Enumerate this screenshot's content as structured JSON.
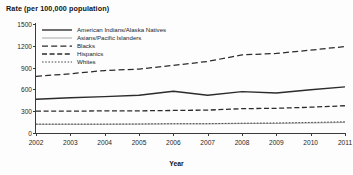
{
  "chart_data": {
    "type": "line",
    "title": "Rate (per 100,000 population)",
    "xlabel": "Year",
    "ylabel": "",
    "categories": [
      "2002",
      "2003",
      "2004",
      "2005",
      "2006",
      "2007",
      "2008",
      "2009",
      "2010",
      "2011"
    ],
    "x": [
      2002,
      2003,
      2004,
      2005,
      2006,
      2007,
      2008,
      2009,
      2010,
      2011
    ],
    "xlim": [
      2002,
      2011
    ],
    "ylim": [
      0,
      1500
    ],
    "yticks": [
      0,
      300,
      600,
      900,
      1200,
      1500
    ],
    "ytick_labels": [
      "0",
      "300",
      "600",
      "900",
      "1200",
      "1500"
    ],
    "xticks": [
      2002,
      2003,
      2004,
      2005,
      2006,
      2007,
      2008,
      2009,
      2010,
      2011
    ],
    "xtick_labels": [
      "2002",
      "2003",
      "2004",
      "2005",
      "2006",
      "2007",
      "2008",
      "2009",
      "2010",
      "2011"
    ],
    "grid": false,
    "legend_position": "upper-left-inside",
    "series": [
      {
        "name": "American Indians/Alaska Natives",
        "style": "solid",
        "color": "#2b2b2b",
        "values": [
          465,
          485,
          500,
          520,
          575,
          520,
          570,
          550,
          595,
          635
        ]
      },
      {
        "name": "Asians/Pacific Islanders",
        "style": "thin-solid",
        "color": "#8c8c8c",
        "values": [
          120,
          120,
          120,
          122,
          125,
          125,
          130,
          132,
          138,
          145
        ]
      },
      {
        "name": "Blacks",
        "style": "long-dash",
        "color": "#2b2b2b",
        "values": [
          780,
          815,
          860,
          880,
          930,
          985,
          1075,
          1095,
          1140,
          1190
        ]
      },
      {
        "name": "Hispanics",
        "style": "dash",
        "color": "#2b2b2b",
        "values": [
          300,
          300,
          305,
          305,
          310,
          315,
          335,
          340,
          355,
          375
        ]
      },
      {
        "name": "Whites",
        "style": "dotted",
        "color": "#4a4a4a",
        "values": [
          122,
          122,
          122,
          124,
          128,
          128,
          135,
          138,
          145,
          155
        ]
      }
    ]
  },
  "legend": {
    "entries": [
      {
        "label": "American Indians/Alaska Natives"
      },
      {
        "label": "Asians/Pacific Islanders"
      },
      {
        "label": "Blacks"
      },
      {
        "label": "Hispanics"
      },
      {
        "label": "Whites"
      }
    ]
  }
}
